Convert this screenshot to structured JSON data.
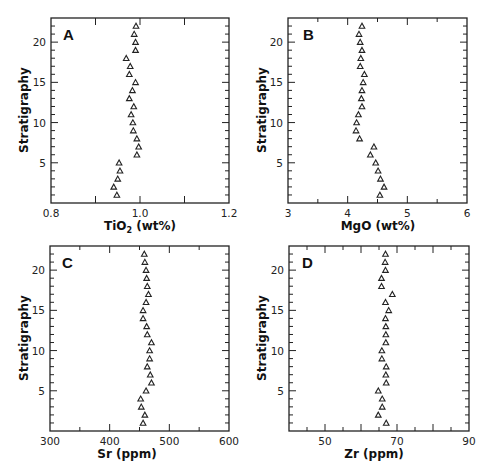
{
  "chart_data": [
    {
      "type": "scatter",
      "panel": "A",
      "title": "",
      "xlabel": "TiO2 (wt%)",
      "xlabel_main": "TiO",
      "xlabel_sub": "2",
      "xlabel_rest": " (wt%)",
      "ylabel": "Stratigraphy",
      "xlim": [
        0.8,
        1.2
      ],
      "ylim": [
        0,
        23
      ],
      "x_major_ticks": [
        0.8,
        0.9,
        1.0,
        1.1,
        1.2
      ],
      "x_tick_labels": [
        {
          "value": 0.8,
          "label": "0.8"
        },
        {
          "value": 1.0,
          "label": "1.0"
        },
        {
          "value": 1.2,
          "label": "1.2"
        }
      ],
      "x_minor_ticks": [],
      "y_major_ticks": [
        5,
        10,
        15,
        20
      ],
      "y_tick_labels": [
        "5",
        "10",
        "15",
        "20"
      ],
      "y_minor_step": 1,
      "marker": "open-triangle",
      "grid": false,
      "y": [
        1,
        2,
        3,
        4,
        5,
        6,
        7,
        8,
        9,
        10,
        11,
        12,
        13,
        14,
        15,
        16,
        17,
        18,
        19,
        20,
        21,
        22
      ],
      "x": [
        0.948,
        0.941,
        0.95,
        0.955,
        0.953,
        0.993,
        0.997,
        0.993,
        0.985,
        0.984,
        0.98,
        0.986,
        0.976,
        0.983,
        0.99,
        0.976,
        0.978,
        0.969,
        0.99,
        0.99,
        0.987,
        0.991
      ]
    },
    {
      "type": "scatter",
      "panel": "B",
      "title": "",
      "xlabel": "MgO (wt%)",
      "xlabel_main": "MgO (wt%)",
      "xlabel_sub": "",
      "xlabel_rest": "",
      "ylabel": "Stratigraphy",
      "xlim": [
        3,
        6
      ],
      "ylim": [
        0,
        23
      ],
      "x_major_ticks": [
        3,
        4,
        5,
        6
      ],
      "x_tick_labels": [
        {
          "value": 3,
          "label": "3"
        },
        {
          "value": 4,
          "label": "4"
        },
        {
          "value": 5,
          "label": "5"
        },
        {
          "value": 6,
          "label": "6"
        }
      ],
      "x_minor_ticks": [
        3.5,
        4.5,
        5.5
      ],
      "y_major_ticks": [
        5,
        10,
        15,
        20
      ],
      "y_tick_labels": [
        "5",
        "10",
        "15",
        "20"
      ],
      "y_minor_step": 1,
      "marker": "open-triangle",
      "grid": false,
      "y": [
        1,
        2,
        3,
        4,
        5,
        6,
        7,
        8,
        9,
        10,
        11,
        12,
        13,
        14,
        15,
        16,
        17,
        18,
        19,
        20,
        21,
        22
      ],
      "x": [
        4.54,
        4.61,
        4.55,
        4.51,
        4.47,
        4.38,
        4.44,
        4.2,
        4.14,
        4.15,
        4.18,
        4.24,
        4.23,
        4.24,
        4.26,
        4.28,
        4.21,
        4.22,
        4.24,
        4.21,
        4.19,
        4.24
      ]
    },
    {
      "type": "scatter",
      "panel": "C",
      "title": "",
      "xlabel": "Sr (ppm)",
      "xlabel_main": "Sr (ppm)",
      "xlabel_sub": "",
      "xlabel_rest": "",
      "ylabel": "Stratigraphy",
      "xlim": [
        300,
        600
      ],
      "ylim": [
        0,
        23
      ],
      "x_major_ticks": [
        300,
        400,
        500,
        600
      ],
      "x_tick_labels": [
        {
          "value": 300,
          "label": "300"
        },
        {
          "value": 400,
          "label": "400"
        },
        {
          "value": 500,
          "label": "500"
        },
        {
          "value": 600,
          "label": "600"
        }
      ],
      "x_minor_ticks": [
        350,
        450,
        550
      ],
      "y_major_ticks": [
        5,
        10,
        15,
        20
      ],
      "y_tick_labels": [
        "5",
        "10",
        "15",
        "20"
      ],
      "y_minor_step": 1,
      "marker": "open-triangle",
      "grid": false,
      "y": [
        1,
        2,
        3,
        4,
        5,
        6,
        7,
        8,
        9,
        10,
        11,
        12,
        13,
        14,
        15,
        16,
        17,
        18,
        19,
        20,
        21,
        22
      ],
      "x": [
        456,
        459,
        453,
        452,
        461,
        470,
        468,
        463,
        467,
        467,
        470,
        463,
        462,
        456,
        456,
        461,
        465,
        463,
        462,
        461,
        459,
        458
      ]
    },
    {
      "type": "scatter",
      "panel": "D",
      "title": "",
      "xlabel": "Zr (ppm)",
      "xlabel_main": "Zr (ppm)",
      "xlabel_sub": "",
      "xlabel_rest": "",
      "ylabel": "Stratigraphy",
      "xlim": [
        40,
        90
      ],
      "ylim": [
        0,
        23
      ],
      "x_major_ticks": [
        40,
        50,
        60,
        70,
        80,
        90
      ],
      "x_tick_labels": [
        {
          "value": 50,
          "label": "50"
        },
        {
          "value": 70,
          "label": "70"
        },
        {
          "value": 90,
          "label": "90"
        }
      ],
      "x_minor_ticks": [
        45,
        55,
        65,
        75,
        85
      ],
      "y_major_ticks": [
        5,
        10,
        15,
        20
      ],
      "y_tick_labels": [
        "5",
        "10",
        "15",
        "20"
      ],
      "y_minor_step": 1,
      "marker": "open-triangle",
      "grid": false,
      "y": [
        1,
        2,
        3,
        4,
        5,
        6,
        7,
        8,
        9,
        10,
        11,
        12,
        13,
        14,
        15,
        16,
        17,
        18,
        19,
        20,
        21,
        22
      ],
      "x": [
        67.0,
        64.8,
        65.9,
        65.9,
        64.8,
        67.0,
        66.9,
        67.0,
        65.8,
        65.8,
        66.9,
        66.9,
        66.9,
        66.8,
        67.7,
        66.8,
        68.7,
        65.7,
        65.7,
        66.8,
        66.7,
        66.8
      ]
    }
  ],
  "panels": [
    {
      "letter": "A",
      "ylabel": "Stratigraphy",
      "xlabel": "TiO2 (wt%)"
    },
    {
      "letter": "B",
      "ylabel": "Stratigraphy",
      "xlabel": "MgO (wt%)"
    },
    {
      "letter": "C",
      "ylabel": "Stratigraphy",
      "xlabel": "Sr (ppm)"
    },
    {
      "letter": "D",
      "ylabel": "Stratigraphy",
      "xlabel": "Zr (ppm)"
    }
  ],
  "colors": {
    "axis": "#222222",
    "marker_stroke": "#222222",
    "background": "#ffffff"
  }
}
